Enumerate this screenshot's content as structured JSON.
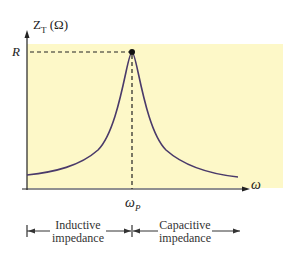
{
  "figure": {
    "y_axis_label": "Z",
    "y_axis_subscript": "T",
    "y_axis_unit": "(Ω)",
    "x_axis_label": "ω",
    "peak_value_label": "R",
    "peak_freq_label": "ω",
    "peak_freq_subscript": "P",
    "regions": [
      {
        "line1": "Inductive",
        "line2": "impedance"
      },
      {
        "line1": "Capacitive",
        "line2": "impedance"
      }
    ],
    "colors": {
      "background": "#fdf8c8",
      "curve": "#4a3a6a",
      "axis": "#222222"
    }
  }
}
